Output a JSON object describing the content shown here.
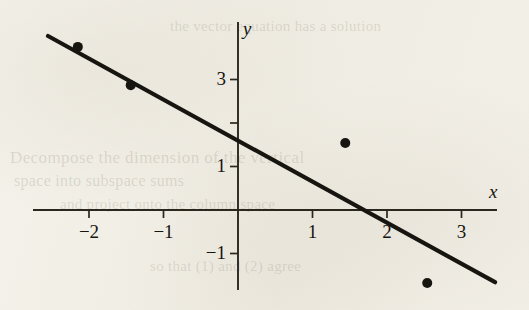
{
  "figure": {
    "name": "scatter-plot-with-least-squares-line",
    "background_color": "#f2efe7",
    "ink_color": "#17150f"
  },
  "axes": {
    "x_label": "x",
    "y_label": "y",
    "x_ticks": [
      {
        "value": -2,
        "label": "−2"
      },
      {
        "value": -1,
        "label": "−1"
      },
      {
        "value": 1,
        "label": "1"
      },
      {
        "value": 2,
        "label": "2"
      },
      {
        "value": 3,
        "label": "3"
      }
    ],
    "y_ticks": [
      {
        "value": 3,
        "label": "3"
      },
      {
        "value": 2,
        "label": ""
      },
      {
        "value": 1,
        "label": "1"
      },
      {
        "value": -1,
        "label": "−1"
      }
    ]
  },
  "ghost": {
    "line1": "Decompose  the  dimension  of  the  vertical",
    "line2": "space  into  subspace  sums",
    "line3": "and  project  onto  the  column  space",
    "line4": "so  that  (1)  and  (2)  agree",
    "line5": "the  vector  equation  has  a  solution"
  },
  "chart_data": {
    "type": "scatter",
    "title": "",
    "xlabel": "x",
    "ylabel": "y",
    "xlim": [
      -2.75,
      3.5
    ],
    "ylim": [
      -2.15,
      4.3
    ],
    "grid": false,
    "legend": "none",
    "series": [
      {
        "name": "data points",
        "marker": "filled-circle",
        "points": [
          {
            "x": -2.15,
            "y": 3.75
          },
          {
            "x": -1.44,
            "y": 2.87
          },
          {
            "x": 1.44,
            "y": 1.54
          },
          {
            "x": 2.54,
            "y": -1.68
          }
        ]
      },
      {
        "name": "least-squares line",
        "type": "line",
        "x_start": -2.55,
        "y_start": 4.0,
        "x_end": 3.45,
        "y_end": -1.66,
        "slope": -0.944,
        "intercept": 1.592,
        "x_intercept": 1.69
      }
    ]
  }
}
